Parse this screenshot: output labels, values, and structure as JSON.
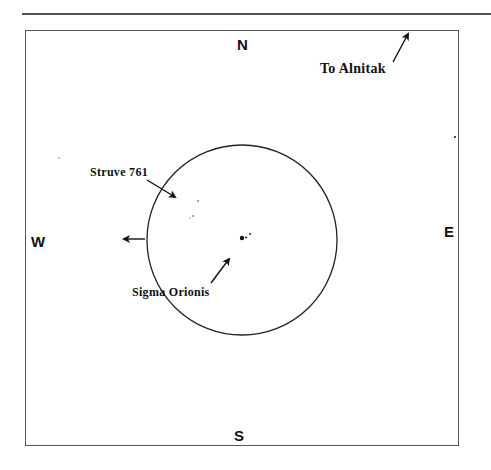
{
  "figure": {
    "compass": {
      "north": "N",
      "south": "S",
      "east": "E",
      "west": "W"
    },
    "labels": {
      "alnitak": "To Alnitak",
      "struve": "Struve 761",
      "sigma": "Sigma Orionis"
    },
    "field_circle": {
      "cx": 242,
      "cy": 240,
      "r": 95
    },
    "colors": {
      "ink": "#111111",
      "frame": "#555555"
    }
  }
}
